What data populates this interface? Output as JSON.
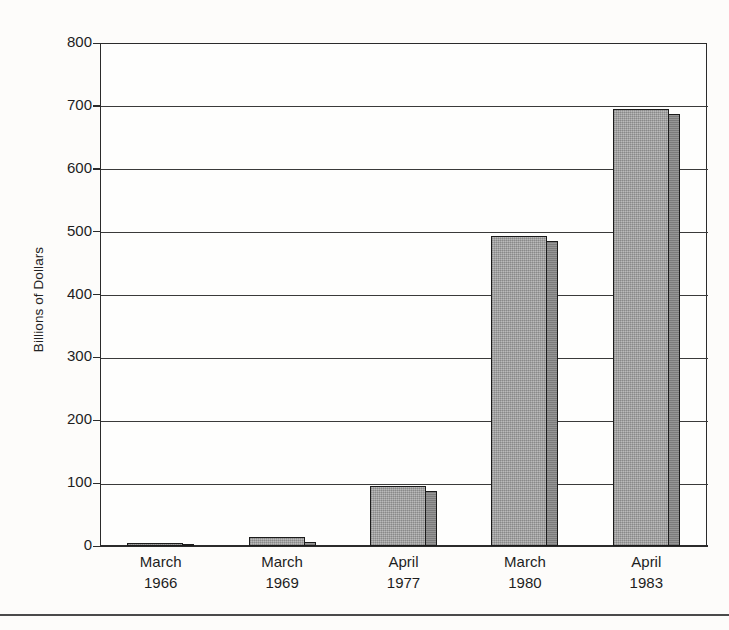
{
  "chart_data": {
    "type": "bar",
    "title": "",
    "subtitle": "",
    "xlabel": "",
    "ylabel": "Billions of Dollars",
    "categories": [
      "March 1966",
      "March 1969",
      "April 1977",
      "March 1980",
      "April 1983"
    ],
    "category_lines": [
      {
        "month": "March",
        "year": "1966"
      },
      {
        "month": "March",
        "year": "1969"
      },
      {
        "month": "April",
        "year": "1977"
      },
      {
        "month": "March",
        "year": "1980"
      },
      {
        "month": "April",
        "year": "1983"
      }
    ],
    "values": [
      5,
      15,
      96,
      493,
      695
    ],
    "ylim": [
      0,
      800
    ],
    "yticks": [
      0,
      100,
      200,
      300,
      400,
      500,
      600,
      700,
      800
    ],
    "ytick_labels": [
      "0",
      "100",
      "200",
      "300",
      "400",
      "500",
      "600",
      "700",
      "800"
    ],
    "grid": "horizontal",
    "legend": "none",
    "bar_style": "3d-shaded-gray",
    "colors": {
      "bar_front": "#a9a9a9",
      "bar_side": "#8f8f8f",
      "bar_top": "#8a8a8a",
      "bar_outline": "#1b1b1b",
      "axis": "#2b2b2b",
      "grid": "#3a3a3a",
      "background": "#fdfcfa",
      "text": "#1e1e1e"
    }
  }
}
